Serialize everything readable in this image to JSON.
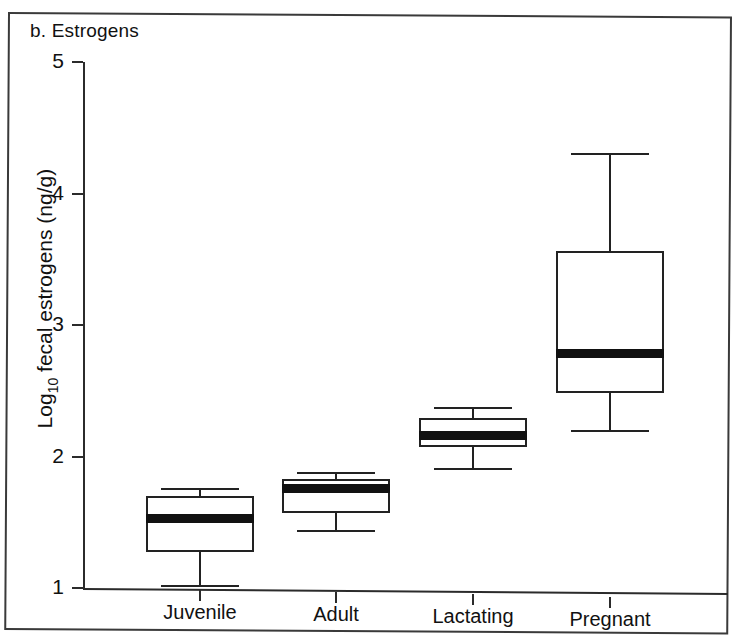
{
  "figure": {
    "panel_label": "b. Estrogens",
    "ylabel_prefix": "Log",
    "ylabel_sub": "10",
    "ylabel_suffix": " fecal estrogens (ng/g)"
  },
  "chart_data": {
    "type": "boxplot",
    "title": "b. Estrogens",
    "xlabel": "",
    "ylabel": "Log10 fecal estrogens (ng/g)",
    "ylim": [
      1,
      5
    ],
    "yticks": [
      1,
      2,
      3,
      4,
      5
    ],
    "ytick_labels": [
      "1",
      "2",
      "3",
      "4",
      "5"
    ],
    "grid": false,
    "legend": "none",
    "categories": [
      "Juvenile",
      "Adult",
      "Lactating",
      "Pregnant"
    ],
    "boxes": [
      {
        "category": "Juvenile",
        "whisker_low": 1.02,
        "q1": 1.27,
        "median": 1.53,
        "q3": 1.7,
        "whisker_high": 1.76
      },
      {
        "category": "Adult",
        "whisker_low": 1.44,
        "q1": 1.57,
        "median": 1.76,
        "q3": 1.83,
        "whisker_high": 1.88
      },
      {
        "category": "Lactating",
        "whisker_low": 1.91,
        "q1": 2.07,
        "median": 2.16,
        "q3": 2.29,
        "whisker_high": 2.38
      },
      {
        "category": "Pregnant",
        "whisker_low": 2.2,
        "q1": 2.48,
        "median": 2.78,
        "q3": 3.56,
        "whisker_high": 4.31
      }
    ]
  },
  "colors": {
    "axis": "#2b2b2b",
    "box_outline": "#222222",
    "median_fill": "#111111",
    "background": "#ffffff",
    "frame": "#3a3a3a"
  }
}
